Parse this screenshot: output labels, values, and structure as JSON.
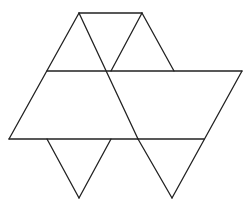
{
  "diagram": {
    "type": "polyhedron-net",
    "stroke_color": "#222222",
    "background": "#ffffff",
    "stroke_width": 1.3,
    "segments": [
      {
        "id": "top-edge",
        "x1": 79,
        "y1": 13,
        "x2": 142,
        "y2": 13
      },
      {
        "id": "left-outer-edge",
        "x1": 79,
        "y1": 13,
        "x2": 9,
        "y2": 139
      },
      {
        "id": "top-left-diagonal",
        "x1": 79,
        "y1": 13,
        "x2": 138,
        "y2": 139
      },
      {
        "id": "top-right-inner",
        "x1": 142,
        "y1": 13,
        "x2": 111,
        "y2": 71
      },
      {
        "id": "top-right-outer",
        "x1": 142,
        "y1": 13,
        "x2": 174,
        "y2": 71
      },
      {
        "id": "middle-line",
        "x1": 47,
        "y1": 71,
        "x2": 242,
        "y2": 71
      },
      {
        "id": "right-outer-edge",
        "x1": 242,
        "y1": 71,
        "x2": 172,
        "y2": 198
      },
      {
        "id": "bottom-line",
        "x1": 9,
        "y1": 139,
        "x2": 204,
        "y2": 139
      },
      {
        "id": "bottom-left-tri-left",
        "x1": 47,
        "y1": 139,
        "x2": 79,
        "y2": 198
      },
      {
        "id": "bottom-left-tri-right",
        "x1": 111,
        "y1": 139,
        "x2": 79,
        "y2": 198
      },
      {
        "id": "bottom-right-tri-left",
        "x1": 138,
        "y1": 139,
        "x2": 172,
        "y2": 198
      }
    ]
  }
}
